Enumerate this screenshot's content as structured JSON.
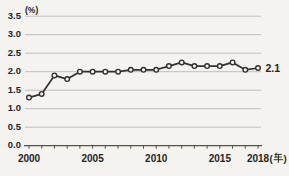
{
  "chart_data": {
    "type": "line",
    "title": "",
    "x": [
      2000,
      2001,
      2002,
      2003,
      2004,
      2005,
      2006,
      2007,
      2008,
      2009,
      2010,
      2011,
      2012,
      2013,
      2014,
      2015,
      2016,
      2017,
      2018
    ],
    "series": [
      {
        "name": "percentage-trend",
        "values": [
          1.3,
          1.4,
          1.9,
          1.8,
          2.0,
          2.0,
          2.0,
          2.0,
          2.05,
          2.05,
          2.05,
          2.15,
          2.25,
          2.15,
          2.15,
          2.15,
          2.25,
          2.05,
          2.1
        ]
      }
    ],
    "end_label": "2.1",
    "ylabel_unit": "(%)",
    "xlabel_unit": "(年)",
    "ylim": [
      0.0,
      3.5
    ],
    "y_ticks": [
      0.0,
      0.5,
      1.0,
      1.5,
      2.0,
      2.5,
      3.0,
      3.5
    ],
    "x_tick_labels": [
      "2000",
      "2005",
      "2010",
      "2015",
      "2018"
    ],
    "x_tick_years_labeled": [
      2000,
      2005,
      2010,
      2015,
      2018
    ],
    "grid": "horizontal-only",
    "legend": "none",
    "colors": {
      "line": "#33312e",
      "marker_fill": "#f4f3f0",
      "marker_stroke": "#33312e",
      "grid": "#bfbeba",
      "axis": "#55514c",
      "text": "#25231f",
      "background": "#f4f3f0"
    }
  }
}
